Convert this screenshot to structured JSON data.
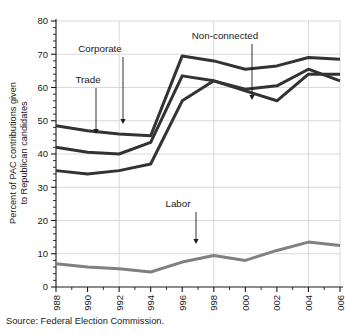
{
  "source_note": "Source: Federal Election Commission.",
  "axis": {
    "ylabel_line1": "Percent of PAC contributions given",
    "ylabel_line2": "to Republican candidates",
    "yticks": [
      "0",
      "10",
      "20",
      "30",
      "40",
      "50",
      "60",
      "70",
      "80"
    ],
    "xticks": [
      "1988",
      "1990",
      "1992",
      "1994",
      "1996",
      "1998",
      "2000",
      "2002",
      "2004",
      "2006"
    ]
  },
  "annotations": [
    {
      "label": "Trade",
      "text_x": 88,
      "text_y": 83,
      "arrow_x": 96,
      "arrow_y_from": 88,
      "arrow_y_to": 134
    },
    {
      "label": "Corporate",
      "text_x": 100,
      "text_y": 52,
      "arrow_x": 123,
      "arrow_y_from": 57,
      "arrow_y_to": 124
    },
    {
      "label": "Non-connected",
      "text_x": 225,
      "text_y": 39,
      "arrow_x": 252,
      "arrow_y_from": 44,
      "arrow_y_to": 100
    },
    {
      "label": "Labor",
      "text_x": 178,
      "text_y": 207,
      "arrow_x": 196,
      "arrow_y_from": 212,
      "arrow_y_to": 244
    }
  ],
  "colors": {
    "dark_line": "#333333",
    "labor_line": "#808080",
    "gridline": "#cfcfcf",
    "axis": "#1a1a1a",
    "background": "#ffffff"
  },
  "chart_data": {
    "type": "line",
    "title": "",
    "xlabel": "",
    "ylabel": "Percent of PAC contributions given to Republican candidates",
    "ylim": [
      0,
      80
    ],
    "ytick_step": 10,
    "yminor_step": 2,
    "grid": true,
    "legend_position": "inline-annotations",
    "x": [
      1988,
      1990,
      1992,
      1994,
      1996,
      1998,
      2000,
      2002,
      2004,
      2006
    ],
    "series": [
      {
        "name": "Corporate",
        "color": "#333333",
        "values": [
          48.5,
          47.0,
          46.0,
          45.5,
          69.5,
          68.0,
          65.5,
          66.5,
          69.0,
          68.5
        ]
      },
      {
        "name": "Trade",
        "color": "#333333",
        "values": [
          42.0,
          40.5,
          40.0,
          43.5,
          63.5,
          62.0,
          59.5,
          60.5,
          65.5,
          62.0
        ]
      },
      {
        "name": "Non-connected",
        "color": "#333333",
        "values": [
          35.0,
          34.0,
          35.0,
          37.0,
          56.0,
          62.0,
          59.0,
          56.0,
          64.0,
          64.0
        ]
      },
      {
        "name": "Labor",
        "color": "#808080",
        "values": [
          7.0,
          6.0,
          5.5,
          4.5,
          7.5,
          9.5,
          8.0,
          11.0,
          13.5,
          12.5
        ]
      }
    ]
  }
}
